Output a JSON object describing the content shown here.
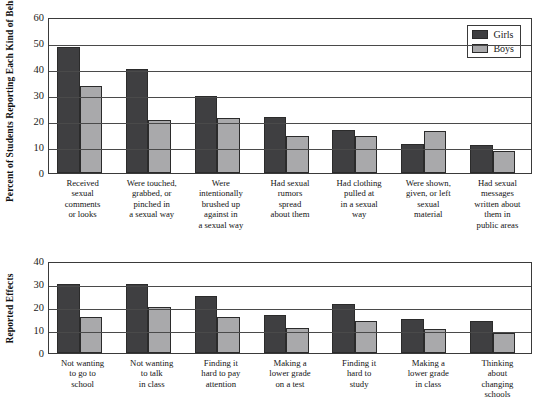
{
  "legend": {
    "position": "top-right",
    "entries": [
      {
        "label": "Girls",
        "color": "#3f3f41"
      },
      {
        "label": "Boys",
        "color": "#a9a9ab"
      }
    ]
  },
  "chart_data": [
    {
      "type": "bar",
      "title": "",
      "xlabel": "",
      "ylabel": "Percent of Students Reporting Each Kind of Behavior",
      "ylim": [
        0,
        60
      ],
      "yticks": [
        0,
        10,
        20,
        30,
        40,
        50,
        60
      ],
      "grid": true,
      "legend": [
        "Girls",
        "Boys"
      ],
      "categories": [
        "Received sexual comments or looks",
        "Were touched, grabbed, or pinched in a sexual way",
        "Were intentionally brushed up against in a sexual way",
        "Had sexual rumors spread about them",
        "Had clothing pulled at in a sexual way",
        "Were shown, given, or left sexual material",
        "Had sexual messages written about them in public areas"
      ],
      "category_lines": [
        [
          "Received",
          "sexual",
          "comments",
          "or looks"
        ],
        [
          "Were touched,",
          "grabbed, or",
          "pinched in",
          "a sexual way"
        ],
        [
          "Were",
          "intentionally",
          "brushed up",
          "against in",
          "a sexual way"
        ],
        [
          "Had sexual",
          "rumors",
          "spread",
          "about them"
        ],
        [
          "Had clothing",
          "pulled at",
          "in a sexual",
          "way"
        ],
        [
          "Were shown,",
          "given, or left",
          "sexual",
          "material"
        ],
        [
          "Had sexual",
          "messages",
          "written about",
          "them in",
          "public areas"
        ]
      ],
      "series": [
        {
          "name": "Girls",
          "color": "#3f3f41",
          "values": [
            48.5,
            40,
            29.5,
            21.5,
            16.5,
            11,
            10.8
          ]
        },
        {
          "name": "Boys",
          "color": "#a9a9ab",
          "values": [
            33.5,
            20.5,
            21,
            14.2,
            14.2,
            16,
            8.3
          ]
        }
      ]
    },
    {
      "type": "bar",
      "title": "",
      "xlabel": "",
      "ylabel": "Reported Effects",
      "ylim": [
        0,
        40
      ],
      "yticks": [
        0,
        10,
        20,
        30,
        40
      ],
      "grid": true,
      "legend": [
        "Girls",
        "Boys"
      ],
      "categories": [
        "Not wanting to go to school",
        "Not wanting to talk in class",
        "Finding it hard to pay attention",
        "Making a lower grade on a test",
        "Finding it hard to study",
        "Making a lower grade in class",
        "Thinking about changing schools"
      ],
      "category_lines": [
        [
          "Not wanting",
          "to go to",
          "school"
        ],
        [
          "Not wanting",
          "to talk",
          "in class"
        ],
        [
          "Finding it",
          "hard to pay",
          "attention"
        ],
        [
          "Making a",
          "lower grade",
          "on a test"
        ],
        [
          "Finding it",
          "hard to",
          "study"
        ],
        [
          "Making a",
          "lower grade",
          "in class"
        ],
        [
          "Thinking",
          "about",
          "changing",
          "schools"
        ]
      ],
      "series": [
        {
          "name": "Girls",
          "color": "#3f3f41",
          "values": [
            30,
            30,
            25,
            16.5,
            21.5,
            15,
            14
          ]
        },
        {
          "name": "Boys",
          "color": "#a9a9ab",
          "values": [
            15.5,
            20,
            15.5,
            11,
            14,
            10.5,
            8.5
          ]
        }
      ]
    }
  ]
}
